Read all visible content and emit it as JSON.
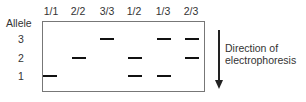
{
  "figure": {
    "row_axis_title": "Allele",
    "columns": [
      {
        "label": "1/1",
        "x": 51,
        "alleles": [
          1
        ]
      },
      {
        "label": "2/2",
        "x": 78,
        "alleles": [
          2
        ]
      },
      {
        "label": "3/3",
        "x": 107,
        "alleles": [
          3
        ]
      },
      {
        "label": "1/2",
        "x": 134,
        "alleles": [
          1,
          2
        ]
      },
      {
        "label": "1/3",
        "x": 163,
        "alleles": [
          1,
          3
        ]
      },
      {
        "label": "2/3",
        "x": 191,
        "alleles": [
          2,
          3
        ]
      }
    ],
    "rows": [
      {
        "label": "3",
        "y": 39
      },
      {
        "label": "2",
        "y": 58
      },
      {
        "label": "1",
        "y": 76
      }
    ],
    "arrow": {
      "label_line1": "Direction of",
      "label_line2": "electrophoresis",
      "direction": "down"
    },
    "colors": {
      "band": "#111111",
      "border": "#777777",
      "text": "#333333"
    }
  }
}
